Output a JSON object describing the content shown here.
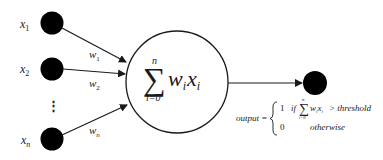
{
  "diagram": {
    "inputs": [
      {
        "label": "x",
        "sub": "1",
        "weight_label": "w",
        "weight_sub": "1"
      },
      {
        "label": "x",
        "sub": "2",
        "weight_label": "w",
        "weight_sub": "2"
      },
      {
        "label": "x",
        "sub": "n",
        "weight_label": "w",
        "weight_sub": "n"
      }
    ],
    "ellipsis": "⋮",
    "summation_node": {
      "sigma": "∑",
      "upper_limit": "n",
      "lower_limit": "i=0",
      "term_w": "w",
      "term_w_sub": "i",
      "term_x": "x",
      "term_x_sub": "i"
    },
    "output_rule": {
      "lhs": "output =",
      "case1_value": "1",
      "case1_condition_prefix": "if",
      "case1_sigma": "∑",
      "case1_sigma_upper": "n",
      "case1_sigma_lower": "i=0",
      "case1_term": "w",
      "case1_term_sub": "i",
      "case1_term2": "x",
      "case1_term2_sub": "i",
      "case1_comparison": "> threshold",
      "case2_value": "0",
      "case2_condition": "otherwise"
    },
    "colors": {
      "node_fill": "#000000",
      "line": "#1a1a1a",
      "background": "#ffffff"
    }
  }
}
